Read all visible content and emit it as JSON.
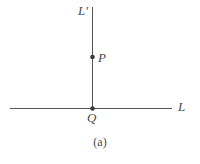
{
  "figure": {
    "caption": "(a)",
    "background_color": "#ffffff",
    "stroke_color": "#555555",
    "text_color": "#4a4a4a",
    "width": 200,
    "height": 164,
    "lines": [
      {
        "id": "vertical-line",
        "label": "L′",
        "x1": 92.5,
        "y1": 7,
        "x2": 92.5,
        "y2": 110,
        "orientation": "vertical",
        "stroke_width": 1
      },
      {
        "id": "horizontal-line",
        "label": "L",
        "x1": 10,
        "y1": 108.5,
        "x2": 172,
        "y2": 108.5,
        "orientation": "horizontal",
        "stroke_width": 1
      }
    ],
    "points": [
      {
        "id": "point-p",
        "label": "P",
        "x": 92.5,
        "y": 57,
        "radius": 2.3,
        "label_position": "right"
      },
      {
        "id": "point-q",
        "label": "Q",
        "x": 92.5,
        "y": 108.5,
        "radius": 2.3,
        "label_position": "below"
      }
    ]
  }
}
